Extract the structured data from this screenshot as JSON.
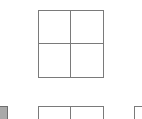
{
  "layout_picker": {
    "tiles": [
      {
        "id": "top-grid",
        "type": "grid-2x2",
        "selected": false
      },
      {
        "id": "bottom-left",
        "type": "filled",
        "color": "#a9a9a9"
      },
      {
        "id": "bottom-center",
        "type": "grid-2x2"
      },
      {
        "id": "bottom-right",
        "type": "single"
      }
    ],
    "colors": {
      "border": "#7a7a7a",
      "fill": "#a9a9a9",
      "background": "#ffffff"
    }
  }
}
